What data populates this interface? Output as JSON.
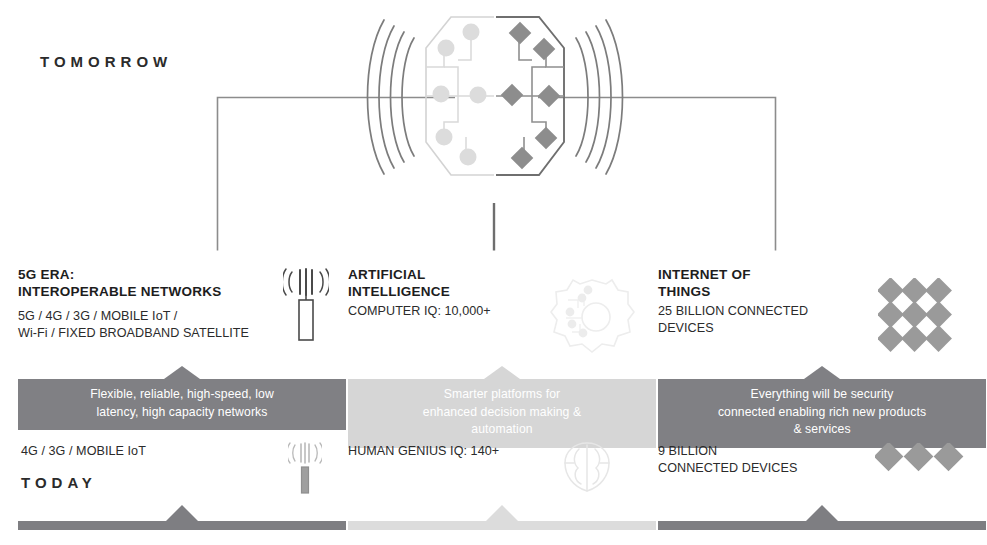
{
  "eras": {
    "future_label": "TOMORROW",
    "present_label": "TODAY"
  },
  "colors": {
    "band_future": "#808084",
    "band_future_middle": "#d6d6d6",
    "rail_dark": "#7e7e82",
    "rail_light": "#dcdcdc",
    "text": "#231f20",
    "band_text": "#ffffff"
  },
  "hero": {
    "icon": "split-hexagon-network-signal-icon",
    "left_half": "light hexagon with circular nodes",
    "right_half": "dark hexagon with diamond nodes",
    "waves_left": 4,
    "waves_right": 4
  },
  "columns": [
    {
      "id": "5g",
      "heading_line1": "5G ERA:",
      "heading_line2": "INTEROPERABLE NETWORKS",
      "subtitle_line1": "5G / 4G / 3G / MOBILE IoT /",
      "subtitle_line2": "Wi-Fi / FIXED BROADBAND SATELLITE",
      "band_line1": "Flexible, reliable, high-speed, low",
      "band_line2": "latency, high capacity networks",
      "band_style": "dark",
      "today_line1": "4G / 3G / MOBILE IoT",
      "today_line2": "",
      "icon_top": "cell-tower-signal-icon",
      "icon_today": "cell-tower-signal-icon-faded",
      "rail_style": "dark"
    },
    {
      "id": "ai",
      "heading_line1": "ARTIFICIAL",
      "heading_line2": "INTELLIGENCE",
      "subtitle_line1": "COMPUTER IQ: 10,000+",
      "subtitle_line2": "",
      "band_line1": "Smarter platforms for",
      "band_line2": "enhanced decision making &",
      "band_line3": "automation",
      "band_style": "light",
      "today_line1": "HUMAN GENIUS IQ: 140+",
      "today_line2": "",
      "icon_top": "gear-network-icon",
      "icon_today": "brain-icon",
      "rail_style": "light"
    },
    {
      "id": "iot",
      "heading_line1": "INTERNET OF",
      "heading_line2": "THINGS",
      "subtitle_line1": "25 BILLION CONNECTED",
      "subtitle_line2": "DEVICES",
      "band_line1": "Everything will be security",
      "band_line2": "connected enabling rich new products",
      "band_line3": "& services",
      "band_style": "dark",
      "today_line1": "9 BILLION",
      "today_line2": "CONNECTED DEVICES",
      "icon_top": "diamond-grid-icon",
      "icon_today": "diamond-row-icon",
      "rail_style": "dark"
    }
  ]
}
